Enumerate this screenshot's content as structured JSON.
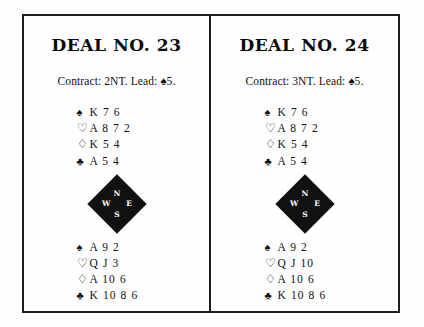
{
  "page": {
    "background_color": "#fdfdfc",
    "border_color": "#1c1c1c"
  },
  "suits": {
    "spade": "♠",
    "heart": "♡",
    "diamond": "♢",
    "club": "♣"
  },
  "compass": {
    "north": "N",
    "south": "S",
    "west": "W",
    "east": "E"
  },
  "deals": [
    {
      "title": "DEAL NO. 23",
      "contract": "Contract: 2NT. Lead: ♠5.",
      "north": [
        {
          "suit": "♠",
          "cards": "K 7 6"
        },
        {
          "suit": "♡",
          "cards": "A 8 7 2"
        },
        {
          "suit": "♢",
          "cards": "K 5 4"
        },
        {
          "suit": "♣",
          "cards": "A 5 4"
        }
      ],
      "south": [
        {
          "suit": "♠",
          "cards": "A 9 2"
        },
        {
          "suit": "♡",
          "cards": "Q J 3"
        },
        {
          "suit": "♢",
          "cards": "A 10 6"
        },
        {
          "suit": "♣",
          "cards": "K 10 8 6"
        }
      ]
    },
    {
      "title": "DEAL NO. 24",
      "contract": "Contract: 3NT. Lead: ♠5.",
      "north": [
        {
          "suit": "♠",
          "cards": "K 7 6"
        },
        {
          "suit": "♡",
          "cards": "A 8 7 2"
        },
        {
          "suit": "♢",
          "cards": "K 5 4"
        },
        {
          "suit": "♣",
          "cards": "A 5 4"
        }
      ],
      "south": [
        {
          "suit": "♠",
          "cards": "A 9 2"
        },
        {
          "suit": "♡",
          "cards": "Q J 10"
        },
        {
          "suit": "♢",
          "cards": "A 10 6"
        },
        {
          "suit": "♣",
          "cards": "K 10 8 6"
        }
      ]
    }
  ]
}
